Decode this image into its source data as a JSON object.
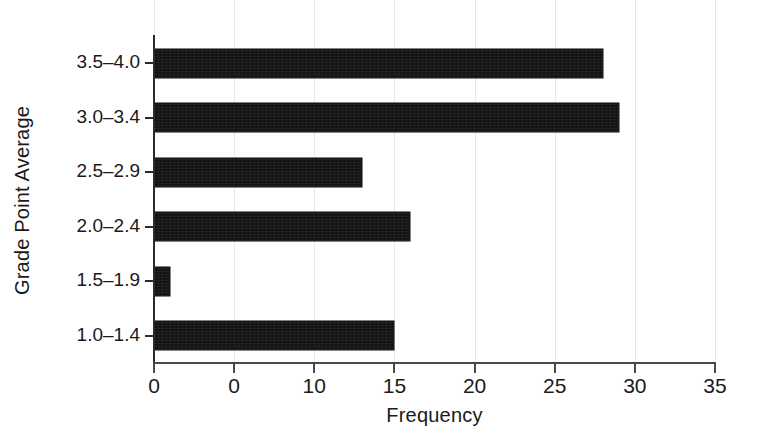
{
  "chart_data": {
    "type": "bar",
    "orientation": "horizontal",
    "title": "",
    "xlabel": "Frequency",
    "ylabel": "Grade Point Average",
    "categories": [
      "1.0–1.4",
      "1.5–1.9",
      "2.0–2.4",
      "2.5–2.9",
      "3.0–3.4",
      "3.5–4.0"
    ],
    "values": [
      15,
      1,
      16,
      13,
      29,
      28
    ],
    "xlim": [
      0,
      35
    ],
    "xticks": [
      0,
      5,
      10,
      15,
      20,
      25,
      30,
      35
    ],
    "xtick_labels": [
      "0",
      "0",
      "10",
      "15",
      "20",
      "25",
      "30",
      "35"
    ],
    "grid": true,
    "grid_axis": "x",
    "legend": false,
    "bar_color": "#131313",
    "grid_color": "#e8e8e8",
    "axis_color": "#2b2b2b",
    "background_color": "#ffffff"
  }
}
